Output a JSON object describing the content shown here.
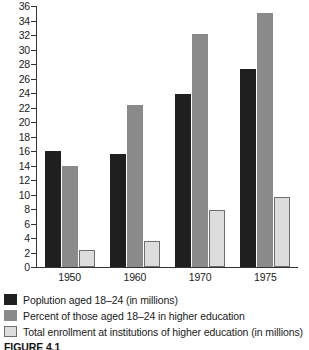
{
  "caption": "FIGURE 4.1",
  "legend": [
    {
      "label": "Poplution aged 18–24 (in millions)",
      "color": "#1f1f1f"
    },
    {
      "label": "Percent of those aged 18–24 in higher education",
      "color": "#8a8a8a"
    },
    {
      "label": "Total enrollment at institutions of higher education (in millions)",
      "color": "#dcdcdc"
    }
  ],
  "chart_data": {
    "type": "bar",
    "title": "",
    "xlabel": "",
    "ylabel": "",
    "ylim": [
      0,
      36
    ],
    "ytick_step": 2,
    "yticks": [
      0,
      2,
      4,
      6,
      8,
      10,
      12,
      14,
      16,
      18,
      20,
      22,
      24,
      26,
      28,
      30,
      32,
      34,
      36
    ],
    "grid": false,
    "legend_position": "below",
    "categories": [
      "1950",
      "1960",
      "1970",
      "1975"
    ],
    "series": [
      {
        "name": "Poplution aged 18–24 (in millions)",
        "color": "#1f1f1f",
        "values": [
          16.0,
          15.6,
          23.8,
          27.3
        ]
      },
      {
        "name": "Percent of those aged 18–24 in higher education",
        "color": "#8a8a8a",
        "values": [
          14.0,
          22.3,
          32.1,
          35.0
        ]
      },
      {
        "name": "Total enrollment at institutions of higher education (in millions)",
        "color": "#dcdcdc",
        "values": [
          2.3,
          3.6,
          7.9,
          9.7
        ]
      }
    ]
  }
}
